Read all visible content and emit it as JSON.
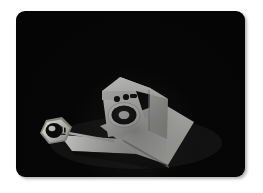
{
  "canvas": {
    "width": 263,
    "height": 193,
    "background_color": "#ffffff"
  },
  "scene_plate": {
    "label": "dark scene backdrop",
    "background_color": "#050505",
    "x": 16,
    "y": 11,
    "width": 229,
    "height": 166,
    "corner_radius": 9
  },
  "objects": {
    "appliance": {
      "label": "white appliance body",
      "description": "boxy white machine with round dark porthole door",
      "front_color": "#f2f2f0",
      "side_color": "#d6d6d2",
      "top_color": "#fbfbfa",
      "shadow_color": "#8e8e8a"
    },
    "porthole": {
      "label": "round door",
      "ring_color": "#ffffff",
      "glass_color": "#0b0b0b",
      "inner_color": "#f4f4f2"
    },
    "control_knobs": {
      "label": "control panel knobs",
      "color": "#101010",
      "count": 3
    },
    "ramp": {
      "label": "white angled platform",
      "top_color": "#ececeb",
      "edge_color": "#c9c9c5"
    },
    "rod": {
      "label": "thin connecting rod",
      "color": "#d8d8d4"
    },
    "hex_badge": {
      "label": "hexagonal nut badge",
      "face_color": "#e9e9e6",
      "bevel_color": "#b9b9b4",
      "center_color": "#0a0a0a",
      "marking_color": "#1a1a1a"
    }
  },
  "palette": {
    "white": "#ffffff",
    "black": "#050505",
    "light_gray": "#ececeb",
    "mid_gray": "#c9c9c5",
    "dark_gray": "#8e8e8a"
  }
}
